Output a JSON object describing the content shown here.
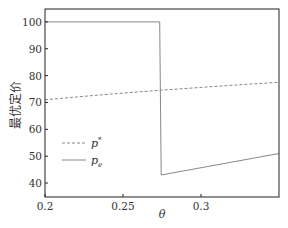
{
  "chart_data": {
    "type": "line",
    "title": "",
    "xlabel": "θ",
    "ylabel": "最优定价",
    "xlim": [
      0.2,
      0.35
    ],
    "ylim": [
      34.8,
      104.8
    ],
    "xticks": [
      0.2,
      0.25,
      0.3
    ],
    "xtick_labels": [
      "0.2",
      "0.25",
      "0.3"
    ],
    "yticks": [
      40,
      50,
      60,
      70,
      80,
      90,
      100
    ],
    "ytick_labels": [
      "40",
      "50",
      "60",
      "70",
      "80",
      "90",
      "100"
    ],
    "grid": false,
    "legend_position": "lower left",
    "series": [
      {
        "name": "p*",
        "style": "dashed",
        "color": "#888888",
        "x": [
          0.2,
          0.225,
          0.25,
          0.275,
          0.3,
          0.325,
          0.35
        ],
        "y": [
          71.0,
          72.3,
          73.5,
          74.6,
          75.6,
          76.6,
          77.5
        ]
      },
      {
        "name": "p_e",
        "style": "solid",
        "color": "#888888",
        "x": [
          0.2,
          0.2735,
          0.2745,
          0.35
        ],
        "y": [
          100,
          100,
          43,
          51
        ]
      }
    ]
  },
  "legend": {
    "items": [
      {
        "label_main": "p",
        "label_sup": "*",
        "label_sub": ""
      },
      {
        "label_main": "p",
        "label_sup": "",
        "label_sub": "e"
      }
    ]
  },
  "axes": {
    "xlabel": "θ",
    "ylabel": "最优定价"
  }
}
